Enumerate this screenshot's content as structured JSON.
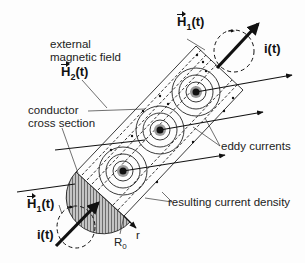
{
  "diagram": {
    "labels": {
      "external_field_line1": "external",
      "external_field_line2": "magnetic field",
      "h2": "H",
      "h2_sub": "2",
      "h2_arg": "(t)",
      "h1_top": "H",
      "h1_top_sub": "1",
      "h1_top_arg": "(t)",
      "h1_bottom": "H",
      "h1_bottom_sub": "1",
      "h1_bottom_arg": "(t)",
      "current_top": "i(t)",
      "current_bottom": "i(t)",
      "conductor_line1": "conductor",
      "conductor_line2": "cross section",
      "eddy": "eddy currents",
      "density": "resulting current density",
      "r_axis": "r",
      "radius": "R",
      "radius_sub": "0"
    },
    "colors": {
      "ink": "#111111",
      "hatch_fill": "#b8b8b8",
      "core_ring": "#9a9a9a",
      "background": "#fdfdfd"
    }
  }
}
